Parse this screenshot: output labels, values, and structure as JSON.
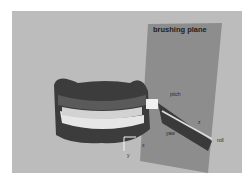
{
  "figure": {
    "title": "brushing plane",
    "labels": {
      "pitch": "pitch",
      "yaw": "yaw",
      "roll": "roll",
      "x": "x",
      "y": "y",
      "z": "z"
    },
    "colors": {
      "background": "#bcbcbc",
      "plane": "#8a8a8a",
      "gums": "#4a4a4a",
      "teeth": "#e8e8e8"
    }
  }
}
